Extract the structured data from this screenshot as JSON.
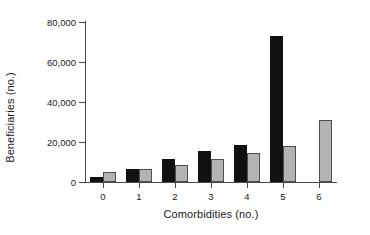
{
  "chart_data": {
    "type": "bar",
    "title": "",
    "subtitle": "",
    "xlabel": "Comorbidities (no.)",
    "ylabel": "Beneficiaries (no.)",
    "categories": [
      "0",
      "1",
      "2",
      "3",
      "4",
      "5",
      "6"
    ],
    "series": [
      {
        "name": "series-black",
        "color": "#111111",
        "values": [
          2500,
          6500,
          11500,
          15500,
          18500,
          73000,
          0
        ]
      },
      {
        "name": "series-gray",
        "color": "#b3b3b3",
        "values": [
          5000,
          6300,
          8500,
          11500,
          14500,
          18000,
          31000
        ]
      }
    ],
    "ylim": [
      0,
      80000
    ],
    "ytick_values": [
      0,
      20000,
      40000,
      60000,
      80000
    ],
    "ytick_labels": [
      "0",
      "20,000",
      "40,000",
      "60,000",
      "80,000"
    ],
    "xtick_labels": [
      "0",
      "1",
      "2",
      "3",
      "4",
      "5",
      "6"
    ],
    "grid": false,
    "legend": false,
    "legend_position": "none",
    "annotations": []
  },
  "axes": {
    "y_title": "Beneficiaries (no.)",
    "x_title": "Comorbidities (no.)"
  }
}
